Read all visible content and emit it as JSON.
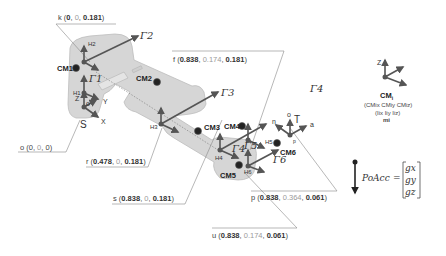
{
  "points": {
    "k": {
      "name": "k",
      "x": "0",
      "y": "0",
      "z": "0.181"
    },
    "o": {
      "name": "o",
      "x": "0",
      "y": "0",
      "z": "0"
    },
    "r": {
      "name": "r",
      "x": "0.478",
      "y": "0",
      "z": "0.181"
    },
    "s": {
      "name": "s",
      "x": "0.838",
      "y": "0",
      "z": "0.181"
    },
    "f": {
      "name": "f",
      "x": "0.838",
      "y": "0.174",
      "z": "0.181"
    },
    "p": {
      "name": "p",
      "x": "0.838",
      "y": "0.364",
      "z": "0.061"
    },
    "u": {
      "name": "u",
      "x": "0.838",
      "y": "0.174",
      "z": "0.061"
    }
  },
  "labels": {
    "base_frame": "S",
    "base_origin": "o",
    "axis_x": "X",
    "axis_y": "Y",
    "axis_z": "Z",
    "tool_frame": "T",
    "tool_n": "n",
    "tool_o": "o",
    "tool_a": "a",
    "tool_p": "p"
  },
  "joints": [
    "H1",
    "H2",
    "H3",
    "H4",
    "H5",
    "H6"
  ],
  "centers_of_mass": [
    "CM1",
    "CM2",
    "CM3",
    "CM4",
    "CM5",
    "CM6"
  ],
  "gammas": [
    "Γ1",
    "Γ2",
    "Γ3",
    "Γ4",
    "Γ5",
    "Γ6"
  ],
  "legend": {
    "axis_label": "Z",
    "cm_title": "CM",
    "cm_sub": "i",
    "cm_coords": "(CMix CMiy CMiz)",
    "inertia": "(Iix Iiy Iiz)",
    "mass": "mi"
  },
  "gravity": {
    "lhs": "PoAcc",
    "eq": "=",
    "components": [
      "gx",
      "gy",
      "gz"
    ]
  },
  "colors": {
    "robot_body": "#d4d4d4",
    "robot_edge": "#b9b9b9",
    "arrow": "#555555",
    "leader_line": "#888888",
    "cm_dot": "#222222"
  }
}
